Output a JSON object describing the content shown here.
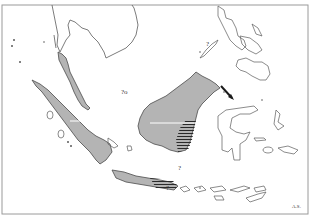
{
  "map": {
    "type": "outline-map",
    "region": "Maritime Southeast Asia",
    "colors": {
      "background": "#ffffff",
      "shaded_land": "#b4b4b4",
      "outline": "#5a5a5a",
      "frame": "#9a9a9a",
      "hatch": "#2a2a2a"
    },
    "annotations": [
      {
        "id": "q-south-china-sea",
        "text": "?o"
      },
      {
        "id": "q-palawan",
        "text": "?"
      },
      {
        "id": "q-java-east",
        "text": "?"
      },
      {
        "id": "q-java-south",
        "text": "?"
      },
      {
        "id": "corner-mark",
        "text": "A.S."
      }
    ],
    "shaded_regions": [
      "Malay Peninsula",
      "Sumatra",
      "Borneo",
      "Java"
    ],
    "outlined_regions": [
      "Indochina",
      "Philippines",
      "Sulawesi",
      "Lesser Sunda Islands",
      "Maluku"
    ]
  }
}
